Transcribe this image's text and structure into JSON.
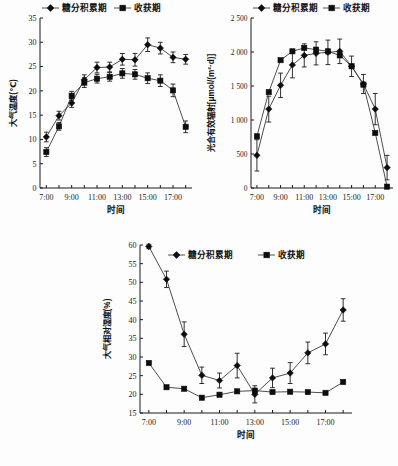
{
  "figure": {
    "legend": {
      "series1_label": "糖分积累期",
      "series1_marker": "diamond-marker-icon",
      "series2_label": "收获期",
      "series2_marker": "square-marker-icon"
    },
    "xlabel": "时间",
    "xticks": [
      "7:00",
      "9:00",
      "11:00",
      "13:00",
      "15:00",
      "17:00"
    ],
    "times": [
      "7:00",
      "8:00",
      "9:00",
      "10:00",
      "11:00",
      "12:00",
      "13:00",
      "14:00",
      "15:00",
      "16:00",
      "17:00",
      "18:00"
    ]
  },
  "chart_data": [
    {
      "type": "line",
      "panel": "a",
      "title": "",
      "xlabel": "时间",
      "ylabel": "大气温度(℃)",
      "ylim": [
        0,
        35
      ],
      "yticks": [
        0,
        5,
        10,
        15,
        20,
        25,
        30,
        35
      ],
      "ytick_labels": [
        "0",
        "5",
        "10",
        "15",
        "20",
        "25",
        "30",
        "35"
      ],
      "xtick_labels": [
        "7:00",
        "9:00",
        "11:00",
        "13:00",
        "15:00",
        "17:00"
      ],
      "x": [
        "7:00",
        "8:00",
        "9:00",
        "10:00",
        "11:00",
        "12:00",
        "13:00",
        "14:00",
        "15:00",
        "16:00",
        "17:00",
        "18:00"
      ],
      "grid": false,
      "legend_position": "top",
      "series": [
        {
          "name": "糖分积累期",
          "marker": "diamond",
          "values": [
            10.5,
            14.9,
            17.5,
            22.3,
            24.8,
            24.9,
            26.5,
            26.4,
            29.5,
            28.8,
            26.9,
            26.5
          ],
          "errors": [
            1.0,
            0.9,
            0.9,
            1.0,
            1.1,
            1.0,
            1.2,
            1.3,
            1.4,
            1.2,
            1.1,
            1.0
          ]
        },
        {
          "name": "收获期",
          "marker": "square",
          "values": [
            7.4,
            12.7,
            19.0,
            21.7,
            22.5,
            22.9,
            23.6,
            23.4,
            22.6,
            22.1,
            20.1,
            12.6
          ],
          "errors": [
            0.9,
            0.8,
            0.9,
            1.0,
            0.9,
            0.9,
            1.0,
            1.0,
            1.1,
            1.2,
            1.3,
            1.2
          ]
        }
      ]
    },
    {
      "type": "line",
      "panel": "b",
      "title": "",
      "xlabel": "时间",
      "ylabel": "光合有效辐射[μmol/(m²·d)]",
      "ylim": [
        0,
        2500
      ],
      "yticks": [
        0,
        500,
        1000,
        1500,
        2000,
        2500
      ],
      "ytick_labels": [
        "0",
        "500",
        "1 000",
        "1 500",
        "2 000",
        "2 500"
      ],
      "xtick_labels": [
        "7:00",
        "9:00",
        "11:00",
        "13:00",
        "15:00",
        "17:00"
      ],
      "x": [
        "7:00",
        "8:00",
        "9:00",
        "10:00",
        "11:00",
        "12:00",
        "13:00",
        "14:00",
        "15:00",
        "16:00",
        "17:00",
        "18:00"
      ],
      "grid": false,
      "legend_position": "top",
      "series": [
        {
          "name": "糖分积累期",
          "marker": "diamond",
          "values": [
            480,
            1160,
            1510,
            1810,
            1950,
            1980,
            1995,
            2010,
            1790,
            1530,
            1160,
            300
          ],
          "errors": [
            230,
            190,
            180,
            190,
            170,
            170,
            180,
            180,
            150,
            140,
            230,
            180
          ]
        },
        {
          "name": "收获期",
          "marker": "square",
          "values": [
            760,
            1410,
            1880,
            2010,
            2060,
            2035,
            2010,
            1950,
            1790,
            1520,
            810,
            20
          ]
        }
      ]
    },
    {
      "type": "line",
      "panel": "c",
      "title": "",
      "xlabel": "时间",
      "ylabel": "大气相对湿度(%)",
      "ylim": [
        15,
        60
      ],
      "yticks": [
        15,
        20,
        25,
        30,
        35,
        40,
        45,
        50,
        55,
        60
      ],
      "ytick_labels": [
        "15",
        "20",
        "25",
        "30",
        "35",
        "40",
        "45",
        "50",
        "55",
        "60"
      ],
      "xtick_labels": [
        "7:00",
        "9:00",
        "11:00",
        "13:00",
        "15:00",
        "17:00"
      ],
      "x": [
        "7:00",
        "8:00",
        "9:00",
        "10:00",
        "11:00",
        "12:00",
        "13:00",
        "14:00",
        "15:00",
        "16:00",
        "17:00",
        "18:00"
      ],
      "grid": false,
      "legend_position": "top",
      "series": [
        {
          "name": "糖分积累期",
          "marker": "diamond",
          "values": [
            59.6,
            50.8,
            36.1,
            25.1,
            23.7,
            27.7,
            20.0,
            24.4,
            25.7,
            31.1,
            33.5,
            42.6
          ],
          "errors": [
            0.6,
            2.2,
            3.3,
            2.2,
            2.0,
            3.3,
            2.3,
            2.6,
            2.8,
            2.9,
            2.9,
            3.0
          ]
        },
        {
          "name": "收获期",
          "marker": "square",
          "values": [
            28.4,
            21.9,
            21.5,
            19.1,
            19.9,
            20.8,
            21.0,
            20.6,
            20.7,
            20.6,
            20.4,
            23.3
          ]
        }
      ]
    }
  ]
}
